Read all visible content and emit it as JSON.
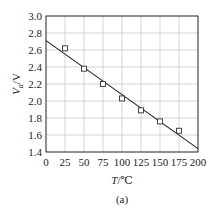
{
  "chart_data": {
    "type": "scatter",
    "title": "",
    "caption": "(a)",
    "xlabel": "T/℃",
    "xlabel_parts": {
      "var": "T",
      "unit": "/℃"
    },
    "ylabel": "Va/V",
    "ylabel_parts": {
      "var": "V",
      "sub": "a",
      "unit": "/V"
    },
    "xlim": [
      0,
      200
    ],
    "ylim": [
      1.4,
      3.0
    ],
    "x_ticks": [
      0,
      25,
      50,
      75,
      100,
      125,
      150,
      175,
      200
    ],
    "y_ticks": [
      1.4,
      1.6,
      1.8,
      2.0,
      2.2,
      2.4,
      2.6,
      2.8,
      3.0
    ],
    "grid": true,
    "legend": null,
    "series": [
      {
        "name": "measured",
        "marker": "open-square",
        "x": [
          25,
          50,
          75,
          100,
          125,
          150,
          175
        ],
        "y": [
          2.62,
          2.38,
          2.2,
          2.03,
          1.89,
          1.76,
          1.65
        ]
      },
      {
        "name": "linear fit",
        "style": "line",
        "x": [
          0,
          200
        ],
        "y": [
          2.71,
          1.44
        ]
      }
    ],
    "colors": {
      "axis": "#222222",
      "grid": "#c8c8c8",
      "line": "#222222",
      "marker": "#333333"
    }
  }
}
